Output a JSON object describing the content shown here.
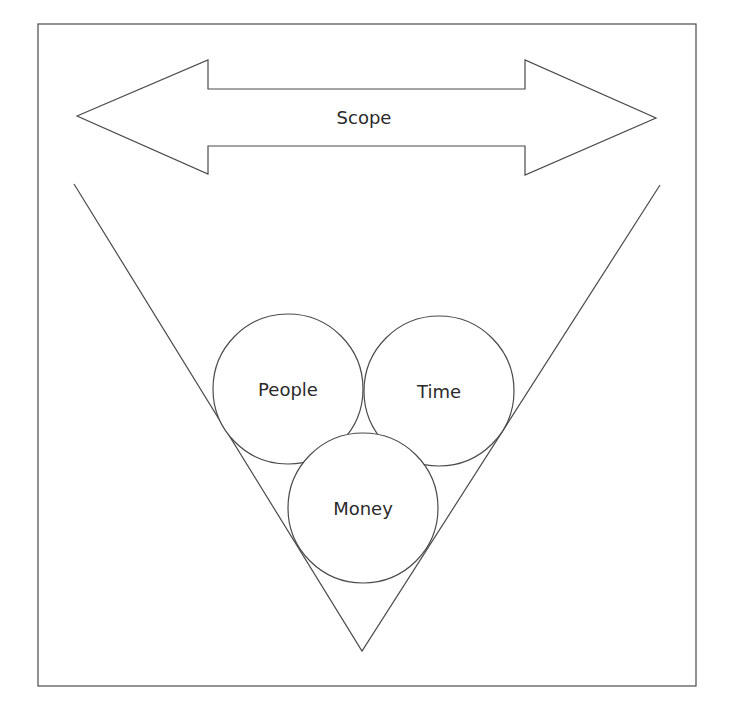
{
  "diagram": {
    "title": "",
    "scope_arrow": {
      "label": "Scope"
    },
    "constraints": [
      {
        "id": "people",
        "label": "People"
      },
      {
        "id": "time",
        "label": "Time"
      },
      {
        "id": "money",
        "label": "Money"
      }
    ],
    "colors": {
      "stroke": "#4a4a4a",
      "text": "#2a2a2a",
      "background": "#ffffff"
    }
  }
}
